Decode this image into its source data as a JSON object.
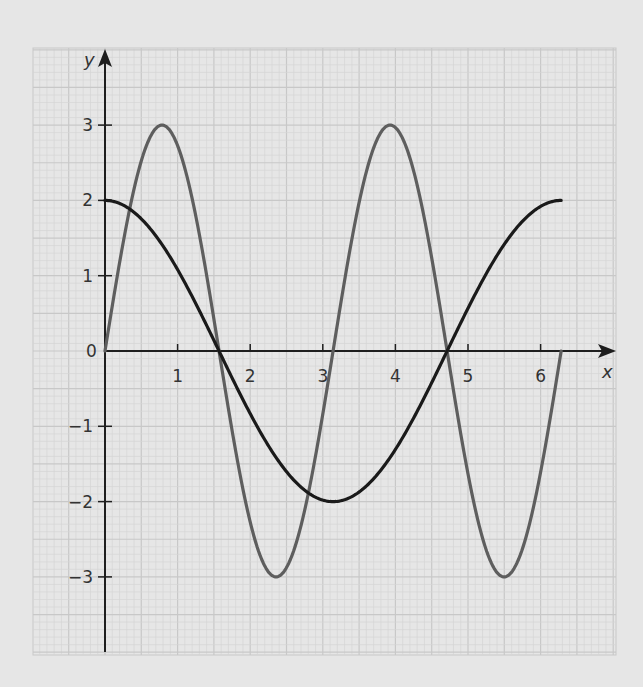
{
  "chart_data": {
    "type": "line",
    "title": "",
    "xlabel": "x",
    "ylabel": "y",
    "xlim": [
      0,
      6.5
    ],
    "ylim": [
      -4,
      4
    ],
    "grid": true,
    "x_ticks": [
      1,
      2,
      3,
      4,
      5,
      6
    ],
    "x_tick_labels": [
      "1",
      "2",
      "3",
      "4",
      "5",
      "6"
    ],
    "y_ticks": [
      3,
      2,
      1,
      0,
      -1,
      -2,
      -3
    ],
    "y_tick_labels": [
      "3",
      "2",
      "1",
      "0",
      "−1",
      "−2",
      "−3"
    ],
    "origin_label": "0",
    "series": [
      {
        "name": "y = 3 sin 2x",
        "color": "#5e5e5e",
        "function": "3*sin(2x)",
        "domain": [
          0,
          6.2832
        ],
        "x": [
          0,
          0.785,
          1.571,
          2.356,
          3.142,
          3.927,
          4.712,
          5.498,
          6.283
        ],
        "values": [
          0,
          3,
          0,
          -3,
          0,
          3,
          0,
          -3,
          0
        ]
      },
      {
        "name": "y = 2 cos x",
        "color": "#1a1a1a",
        "function": "2*cos(x)",
        "domain": [
          0,
          6.2832
        ],
        "x": [
          0,
          1.571,
          3.142,
          4.712,
          6.283
        ],
        "values": [
          2,
          0,
          -2,
          0,
          2
        ]
      }
    ]
  },
  "colors": {
    "background": "#e6e6e6",
    "grid_minor": "#d6d6d6",
    "grid_major": "#c8c8c8",
    "axis": "#1e1e1e"
  }
}
